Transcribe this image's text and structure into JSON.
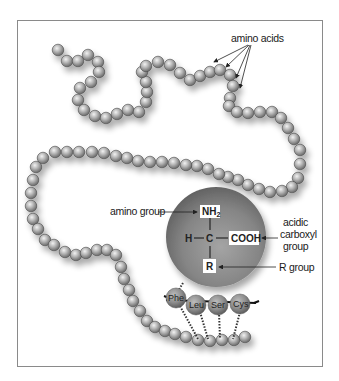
{
  "labels": {
    "amino_acids": "amino acids",
    "amino_group": "amino group",
    "carboxyl_line1": "acidic",
    "carboxyl_line2": "carboxyl",
    "carboxyl_line3": "group",
    "r_group": "R group"
  },
  "structure": {
    "nh2_main": "NH",
    "nh2_sub": "2",
    "h": "H",
    "c": "C",
    "cooh": "COOH",
    "r": "R"
  },
  "sequence_beads": [
    {
      "label": "Phe"
    },
    {
      "label": "Leu"
    },
    {
      "label": "Ser"
    },
    {
      "label": "Cys"
    }
  ],
  "colors": {
    "bead_light": "#e6e6e6",
    "bead_dark": "#6e6e6e",
    "sphere_light": "#a8a8a8",
    "sphere_dark": "#5a5a5a",
    "frame": "#8a8a8a",
    "text": "#1a1a1a"
  }
}
